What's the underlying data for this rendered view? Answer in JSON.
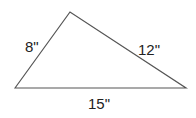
{
  "diagram": {
    "type": "triangle",
    "vertices": {
      "left": [
        15,
        88
      ],
      "top": [
        70,
        12
      ],
      "right": [
        186,
        88
      ]
    },
    "sides": [
      {
        "name": "left-side",
        "label": "8\"",
        "length": 8
      },
      {
        "name": "right-side",
        "label": "12\"",
        "length": 12
      },
      {
        "name": "base",
        "label": "15\"",
        "length": 15
      }
    ],
    "stroke_color": "#555555",
    "text_color": "#222222"
  }
}
